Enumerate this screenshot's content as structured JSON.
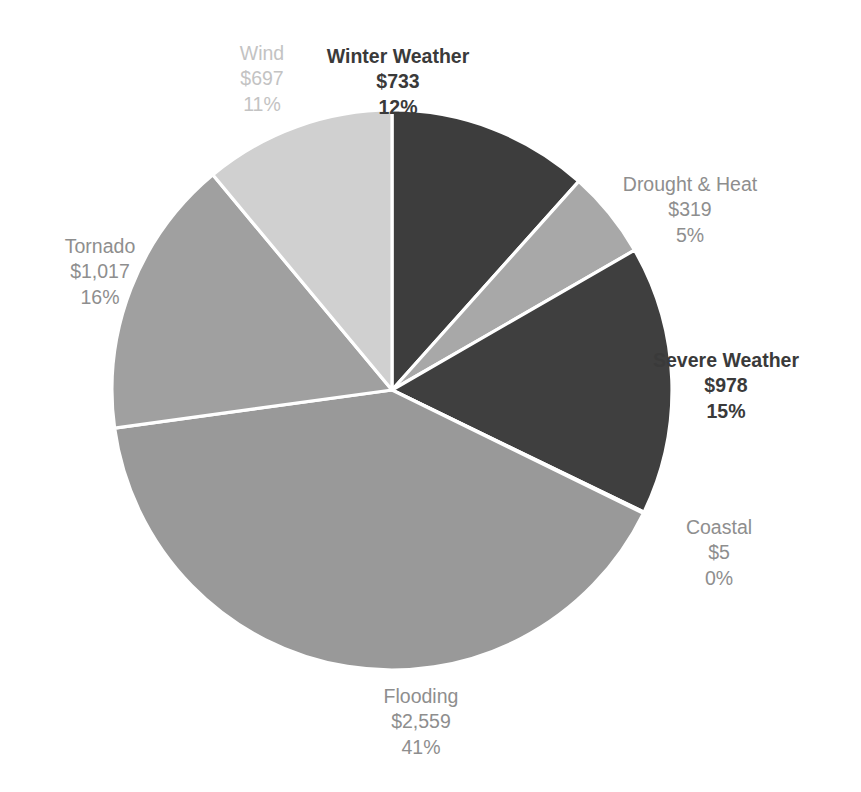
{
  "chart_data": {
    "type": "pie",
    "title": "",
    "subtitle": "",
    "xlabel": "",
    "ylabel": "",
    "legend_position": "none",
    "grid": false,
    "start_angle_deg": 0,
    "direction": "clockwise",
    "units": "billions of dollars",
    "categories": [
      "Winter Weather",
      "Drought & Heat",
      "Severe Weather",
      "Coastal",
      "Flooding",
      "Tornado",
      "Wind"
    ],
    "values": [
      733,
      319,
      978,
      5,
      2559,
      1017,
      697
    ],
    "percentages": [
      12,
      5,
      15,
      0,
      41,
      16,
      11
    ],
    "value_labels": [
      "$733",
      "$319",
      "$978",
      "$5",
      "$2,559",
      "$1,017",
      "$697"
    ],
    "percent_labels": [
      "12%",
      "5%",
      "15%",
      "0%",
      "41%",
      "16%",
      "11%"
    ],
    "colors": [
      "#3d3d3d",
      "#a8a8a8",
      "#3f3f3f",
      "#8f8f8f",
      "#999999",
      "#a0a0a0",
      "#d0d0d0"
    ],
    "slice_separator_color": "#ffffff",
    "background_color": "#ffffff"
  },
  "slices": [
    {
      "id": "winter-weather",
      "name": "Winter Weather",
      "value": "$733",
      "percent": "12%",
      "color": "#3d3d3d",
      "label_style": "dark"
    },
    {
      "id": "drought-heat",
      "name": "Drought & Heat",
      "value": "$319",
      "percent": "5%",
      "color": "#a8a8a8",
      "label_style": "mid"
    },
    {
      "id": "severe-weather",
      "name": "Severe Weather",
      "value": "$978",
      "percent": "15%",
      "color": "#3f3f3f",
      "label_style": "dark"
    },
    {
      "id": "coastal",
      "name": "Coastal",
      "value": "$5",
      "percent": "0%",
      "color": "#8f8f8f",
      "label_style": "mid"
    },
    {
      "id": "flooding",
      "name": "Flooding",
      "value": "$2,559",
      "percent": "41%",
      "color": "#999999",
      "label_style": "mid"
    },
    {
      "id": "tornado",
      "name": "Tornado",
      "value": "$1,017",
      "percent": "16%",
      "color": "#a0a0a0",
      "label_style": "mid"
    },
    {
      "id": "wind",
      "name": "Wind",
      "value": "$697",
      "percent": "11%",
      "color": "#d0d0d0",
      "label_style": "light"
    }
  ]
}
